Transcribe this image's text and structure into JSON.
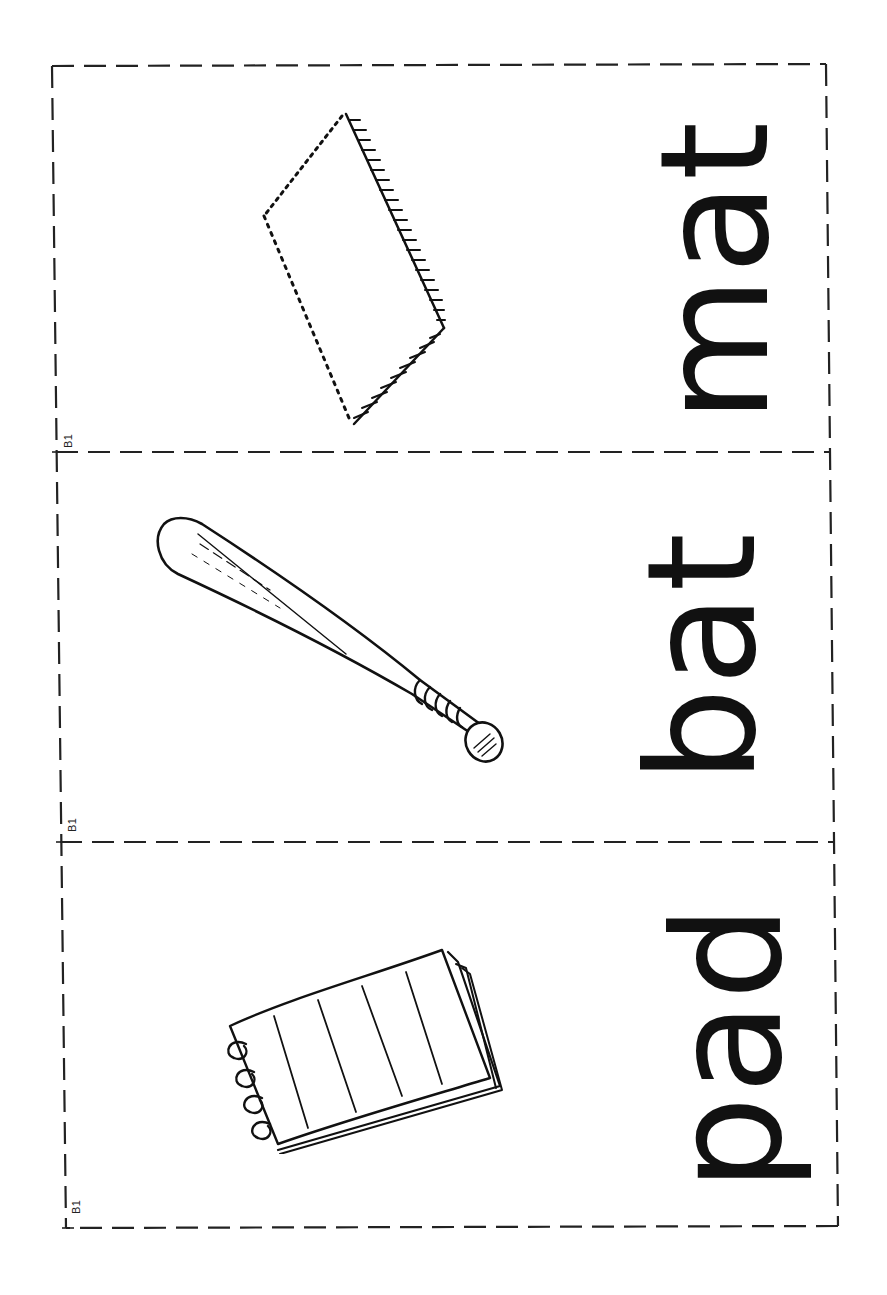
{
  "document": {
    "type": "picture-word flashcards",
    "orientation": "rotated -90deg",
    "cards": [
      {
        "label": "B1",
        "word": "mat",
        "picture": "mat-illustration"
      },
      {
        "label": "B1",
        "word": "bat",
        "picture": "baseball-bat-illustration"
      },
      {
        "label": "B1",
        "word": "pad",
        "picture": "spiral-notepad-illustration"
      }
    ]
  },
  "colors": {
    "ink": "#111111",
    "background": "#ffffff"
  }
}
